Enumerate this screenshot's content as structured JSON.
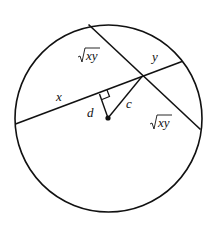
{
  "diagram": {
    "type": "geometry-circle-chords",
    "labels": {
      "x": "x",
      "y": "y",
      "sqrt_xy_top": "xy",
      "sqrt_xy_bottom": "xy",
      "d": "d",
      "c": "c"
    },
    "elements": [
      "circle",
      "chord-x-y",
      "chord-sqrt-xy",
      "perpendicular-d",
      "segment-c",
      "center-point",
      "right-angle-mark"
    ],
    "colors": {
      "stroke": "#111111",
      "background": "#ffffff"
    }
  }
}
